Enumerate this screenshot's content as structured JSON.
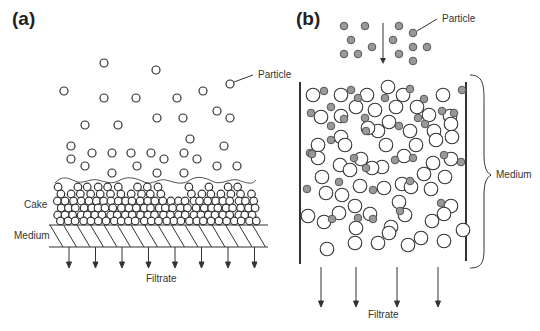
{
  "panels": {
    "a": {
      "label": "(a)",
      "title": "Cake filtration",
      "annotations": {
        "particle": "Particle",
        "cake": "Cake",
        "medium": "Medium",
        "filtrate": "Filtrate"
      },
      "particle_color": "#ffffff",
      "filtrate_arrow_count": 8
    },
    "b": {
      "label": "(b)",
      "title": "Depth filtration",
      "annotations": {
        "particle": "Particle",
        "medium": "Medium",
        "filtrate": "Filtrate"
      },
      "particle_color": "#999999",
      "medium_grain_color": "#ffffff",
      "filtrate_arrow_count": 4
    }
  },
  "colors": {
    "stroke": "#333333",
    "particle_fill_b": "#999999"
  }
}
